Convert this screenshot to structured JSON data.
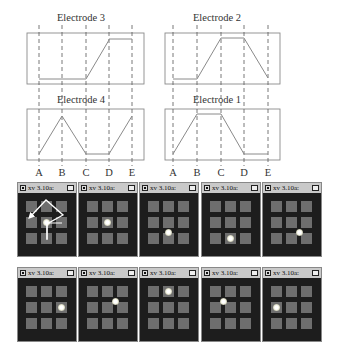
{
  "chart_data": {
    "type": "line",
    "title": "",
    "x": [
      "A",
      "B",
      "C",
      "D",
      "E"
    ],
    "ylim": [
      0,
      1
    ],
    "panels": [
      {
        "name": "Electrode 3",
        "values": [
          0,
          0,
          0,
          1,
          1
        ]
      },
      {
        "name": "Electrode 2",
        "values": [
          0,
          0,
          1,
          1,
          0
        ]
      },
      {
        "name": "Electrode 4",
        "values": [
          0,
          1,
          0,
          0,
          1
        ]
      },
      {
        "name": "Electrode 1",
        "values": [
          0,
          1,
          1,
          0,
          0
        ]
      }
    ],
    "grid": "dashed vertical lines at A–E",
    "xlabel": "",
    "ylabel": ""
  },
  "charts": {
    "top_left_title": "Electrode 3",
    "top_right_title": "Electrode 2",
    "bottom_left_title": "Electrode 4",
    "bottom_right_title": "Electrode 1",
    "left_axis_labels": [
      "A",
      "B",
      "C",
      "D",
      "E"
    ],
    "right_axis_labels": [
      "A",
      "B",
      "C",
      "D",
      "E"
    ]
  },
  "screens": {
    "window_title": "xv 3.10a:",
    "rows": [
      [
        {
          "dot": [
            1,
            1
          ],
          "arrows": true
        },
        {
          "dot": [
            1,
            1
          ]
        },
        {
          "dot": [
            1,
            1.6
          ]
        },
        {
          "dot": [
            1,
            2
          ]
        },
        {
          "dot": [
            1.5,
            1.6
          ]
        }
      ],
      [
        {
          "dot": [
            2,
            1
          ]
        },
        {
          "dot": [
            1.5,
            0.6
          ]
        },
        {
          "dot": [
            1,
            0
          ]
        },
        {
          "dot": [
            0.5,
            0.6
          ]
        },
        {
          "dot": [
            0,
            1
          ]
        }
      ]
    ]
  }
}
